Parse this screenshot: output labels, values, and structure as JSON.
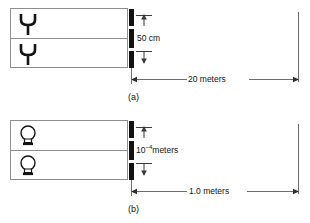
{
  "figure": {
    "background_color": "#ffffff",
    "line_color": "#6d6d6d",
    "bar_color": "#121212",
    "box_border_color": "#8e8e8e"
  },
  "panels": [
    {
      "id": "a",
      "caption": "(a)",
      "emitter_icon": "antenna-icon",
      "emitter_count": 2,
      "separation_label": "50 cm",
      "distance_label": "20 meters",
      "separation_value": 50,
      "separation_unit": "cm",
      "distance_value": 20,
      "distance_unit": "meters"
    },
    {
      "id": "b",
      "caption": "(b)",
      "emitter_icon": "light-bulb-icon",
      "emitter_count": 2,
      "separation_label_base": "10",
      "separation_label_exponent": "−4",
      "separation_label_unit": "meters",
      "distance_label": "1.0 meters",
      "separation_value": 0.0001,
      "separation_unit": "meters",
      "distance_value": 1.0,
      "distance_unit": "meters"
    }
  ]
}
